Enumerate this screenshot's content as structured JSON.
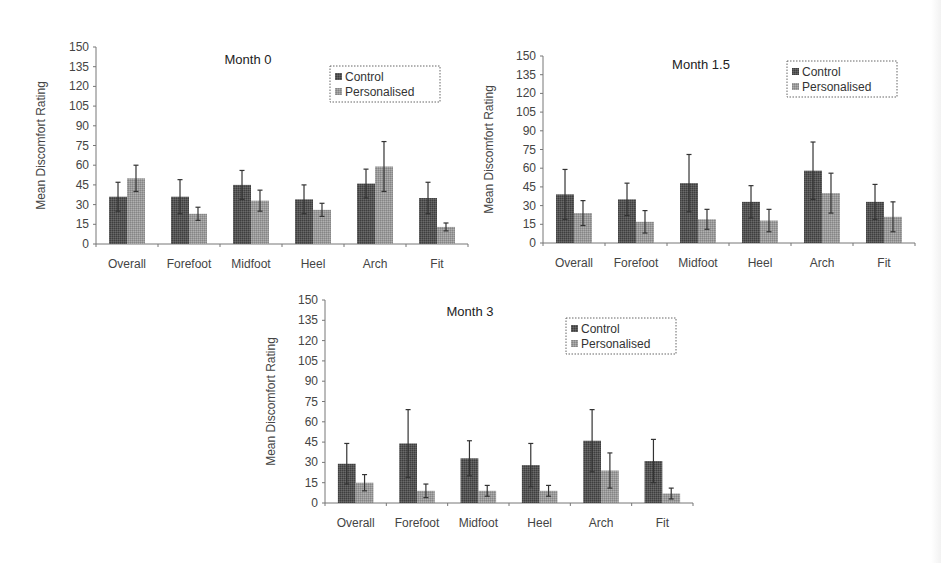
{
  "colors": {
    "control": "#555555",
    "personalised": "#9a9a9a",
    "axis": "#777777",
    "error_bar": "#333333"
  },
  "chart_data": [
    {
      "type": "bar",
      "title": "Month 0",
      "xlabel": "",
      "ylabel": "Mean Discomfort Rating",
      "ylim": [
        0,
        150
      ],
      "yticks": [
        0,
        15,
        30,
        45,
        60,
        75,
        90,
        105,
        120,
        135,
        150
      ],
      "grid": false,
      "legend_position": "top-right",
      "categories": [
        "Overall",
        "Forefoot",
        "Midfoot",
        "Heel",
        "Arch",
        "Fit"
      ],
      "series": [
        {
          "name": "Control",
          "values": [
            36,
            36,
            45,
            34,
            46,
            35
          ],
          "error_upper": [
            47,
            49,
            56,
            45,
            57,
            47
          ]
        },
        {
          "name": "Personalised",
          "values": [
            50,
            23,
            33,
            26,
            59,
            13
          ],
          "error_upper": [
            60,
            28,
            41,
            31,
            78,
            16
          ]
        }
      ]
    },
    {
      "type": "bar",
      "title": "Month 1.5",
      "xlabel": "",
      "ylabel": "Mean Discomfort Rating",
      "ylim": [
        0,
        150
      ],
      "yticks": [
        0,
        15,
        30,
        45,
        60,
        75,
        90,
        105,
        120,
        135,
        150
      ],
      "grid": false,
      "legend_position": "top-right",
      "categories": [
        "Overall",
        "Forefoot",
        "Midfoot",
        "Heel",
        "Arch",
        "Fit"
      ],
      "series": [
        {
          "name": "Control",
          "values": [
            39,
            35,
            48,
            33,
            58,
            33
          ],
          "error_upper": [
            59,
            48,
            71,
            46,
            81,
            47
          ]
        },
        {
          "name": "Personalised",
          "values": [
            24,
            17,
            19,
            18,
            40,
            21
          ],
          "error_upper": [
            34,
            26,
            27,
            27,
            56,
            33
          ]
        }
      ]
    },
    {
      "type": "bar",
      "title": "Month 3",
      "xlabel": "",
      "ylabel": "Mean Discomfort Rating",
      "ylim": [
        0,
        150
      ],
      "yticks": [
        0,
        15,
        30,
        45,
        60,
        75,
        90,
        105,
        120,
        135,
        150
      ],
      "grid": false,
      "legend_position": "top-right",
      "categories": [
        "Overall",
        "Forefoot",
        "Midfoot",
        "Heel",
        "Arch",
        "Fit"
      ],
      "series": [
        {
          "name": "Control",
          "values": [
            29,
            44,
            33,
            28,
            46,
            31
          ],
          "error_upper": [
            44,
            69,
            46,
            44,
            69,
            47
          ]
        },
        {
          "name": "Personalised",
          "values": [
            15,
            9,
            9,
            9,
            24,
            7
          ],
          "error_upper": [
            21,
            14,
            13,
            13,
            37,
            11
          ]
        }
      ]
    }
  ]
}
